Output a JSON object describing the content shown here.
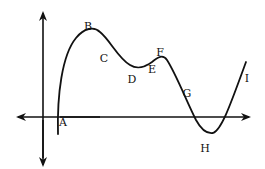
{
  "diagram": {
    "type": "function-graph",
    "colors": {
      "background": "#ffffff",
      "stroke": "#111111",
      "text": "#111111"
    },
    "axes": {
      "x_axis": {
        "y": 117,
        "x_start": 18,
        "x_end": 250,
        "arrows": "both"
      },
      "y_axis": {
        "x": 43,
        "y_start": 12,
        "y_end": 166,
        "arrows": "both"
      }
    },
    "points": [
      {
        "id": "A",
        "label": "A",
        "x": 63,
        "y": 126,
        "meaning": "curve crosses x-axis (zero)"
      },
      {
        "id": "B",
        "label": "B",
        "x": 88,
        "y": 30,
        "meaning": "local maximum"
      },
      {
        "id": "C",
        "label": "C",
        "x": 104,
        "y": 62,
        "meaning": "decreasing segment"
      },
      {
        "id": "D",
        "label": "D",
        "x": 132,
        "y": 83,
        "meaning": "local minimum"
      },
      {
        "id": "E",
        "label": "E",
        "x": 152,
        "y": 73,
        "meaning": "increasing segment"
      },
      {
        "id": "F",
        "label": "F",
        "x": 160,
        "y": 56,
        "meaning": "local maximum"
      },
      {
        "id": "G",
        "label": "G",
        "x": 187,
        "y": 97,
        "meaning": "decreasing segment"
      },
      {
        "id": "H",
        "label": "H",
        "x": 205,
        "y": 152,
        "meaning": "local minimum"
      },
      {
        "id": "I",
        "label": "I",
        "x": 247,
        "y": 82,
        "meaning": "increasing end"
      }
    ],
    "curve_path": "M 58 134 C 57 95, 62 55, 76 38 C 84 28, 94 26, 100 32 C 110 40, 118 58, 130 65 C 138 70, 145 67, 152 62 C 158 57, 163 54, 167 60 C 176 74, 186 100, 196 120 C 202 131, 207 134, 213 133 C 222 130, 232 100, 246 62"
  }
}
